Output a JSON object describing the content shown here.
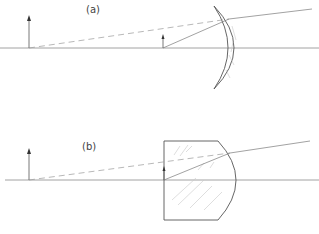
{
  "figure": {
    "panels": [
      {
        "id": "a",
        "label": "(a)",
        "lens_type": "concave-convex meniscus lens",
        "elements": [
          "optical-axis",
          "object-arrow",
          "image-arrow",
          "refracted-ray",
          "virtual-ray-extension"
        ]
      },
      {
        "id": "b",
        "label": "(b)",
        "lens_type": "plano-convex lens block",
        "elements": [
          "optical-axis",
          "object-arrow",
          "image-arrow",
          "refracted-ray",
          "virtual-ray-extension"
        ]
      }
    ]
  }
}
